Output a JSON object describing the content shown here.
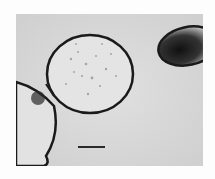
{
  "image": {
    "kind": "micrograph",
    "description": "Grayscale electron micrograph showing round cells with dark membranes",
    "background_color": "#d9d9d9",
    "border_color": "#fdfdfd",
    "scale_bar": {
      "label": ""
    }
  }
}
